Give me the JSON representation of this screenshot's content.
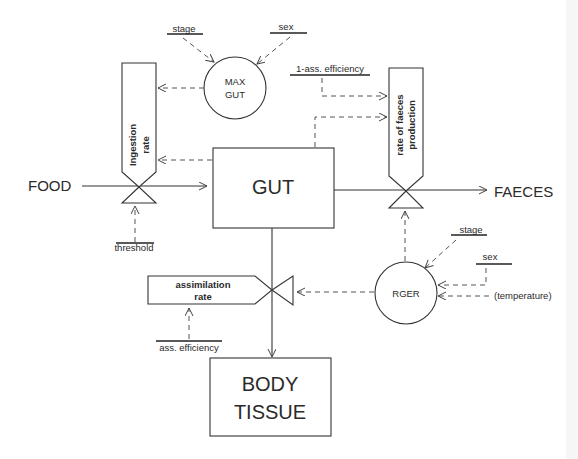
{
  "diagram": {
    "type": "flow-model",
    "nodes": {
      "gut": {
        "label": "GUT"
      },
      "body_tissue": {
        "label_line1": "BODY",
        "label_line2": "TISSUE"
      },
      "max_gut": {
        "label_line1": "MAX",
        "label_line2": "GUT"
      },
      "rger": {
        "label": "RGER"
      },
      "ingestion_rate": {
        "label_line1": "Ingestion",
        "label_line2": "rate"
      },
      "faeces_rate": {
        "label_line1": "rate of faeces",
        "label_line2": "production"
      },
      "assimilation_rate": {
        "label_line1": "assimilation",
        "label_line2": "rate"
      }
    },
    "sources_sinks": {
      "food": "FOOD",
      "faeces": "FAECES"
    },
    "drivers": {
      "stage_top": "stage",
      "sex_top": "sex",
      "one_minus_ass_eff": "1-ass. efficiency",
      "threshold": "threshold",
      "stage_right": "stage",
      "sex_right": "sex",
      "temperature": "(temperature)",
      "ass_efficiency": "ass. efficiency"
    },
    "flows": [
      {
        "from": "FOOD",
        "to": "GUT",
        "via": "Ingestion rate"
      },
      {
        "from": "GUT",
        "to": "FAECES",
        "via": "rate of faeces production"
      },
      {
        "from": "GUT",
        "to": "BODY TISSUE",
        "via": "assimilation rate"
      }
    ],
    "influences": [
      {
        "from": "stage",
        "to": "MAX GUT"
      },
      {
        "from": "sex",
        "to": "MAX GUT"
      },
      {
        "from": "MAX GUT",
        "to": "Ingestion rate"
      },
      {
        "from": "GUT",
        "to": "Ingestion rate"
      },
      {
        "from": "threshold",
        "to": "Ingestion rate"
      },
      {
        "from": "1-ass. efficiency",
        "to": "rate of faeces production"
      },
      {
        "from": "GUT",
        "to": "rate of faeces production"
      },
      {
        "from": "RGER",
        "to": "rate of faeces production"
      },
      {
        "from": "stage",
        "to": "RGER"
      },
      {
        "from": "sex",
        "to": "RGER"
      },
      {
        "from": "(temperature)",
        "to": "RGER"
      },
      {
        "from": "RGER",
        "to": "assimilation rate"
      },
      {
        "from": "ass. efficiency",
        "to": "assimilation rate"
      }
    ]
  }
}
